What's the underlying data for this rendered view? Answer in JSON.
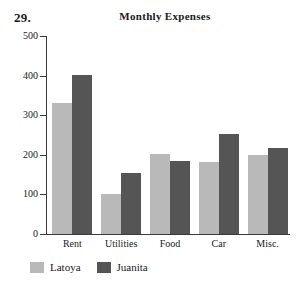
{
  "problem_number": "29.",
  "legend": {
    "position": "bottom-left",
    "items": [
      {
        "label": "Latoya",
        "color": "#b9b9b9"
      },
      {
        "label": "Juanita",
        "color": "#555555"
      }
    ]
  },
  "chart_data": {
    "type": "bar",
    "title": "Monthly Expenses",
    "xlabel": "",
    "ylabel": "",
    "ylim": [
      0,
      500
    ],
    "yticks": [
      0,
      100,
      200,
      300,
      400,
      500
    ],
    "ytick_labels": [
      "0",
      "100",
      "200",
      "300",
      "400",
      "500"
    ],
    "grid": false,
    "legend_position": "bottom-left",
    "categories": [
      "Rent",
      "Utilities",
      "Food",
      "Car",
      "Misc."
    ],
    "series": [
      {
        "name": "Latoya",
        "color": "#b9b9b9",
        "values": [
          330,
          100,
          203,
          183,
          200
        ]
      },
      {
        "name": "Juanita",
        "color": "#555555",
        "values": [
          402,
          153,
          185,
          253,
          217
        ]
      }
    ]
  }
}
